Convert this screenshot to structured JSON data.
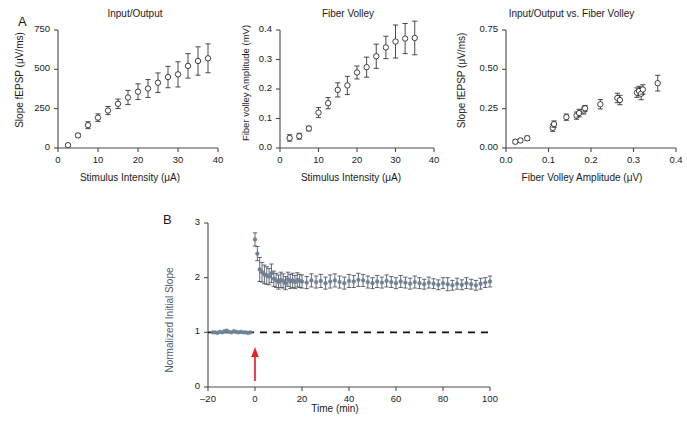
{
  "figure": {
    "panel_a_letter": "A",
    "panel_b_letter": "B"
  },
  "chart_data": [
    {
      "id": "input-output",
      "type": "scatter",
      "title": "Input/Output",
      "xlabel": "Stimulus Intensity (μA)",
      "ylabel": "Slope fEPSP (μV/ms)",
      "xlim": [
        0,
        40
      ],
      "ylim": [
        0,
        750
      ],
      "xticks": [
        0,
        10,
        20,
        30,
        40
      ],
      "xticklabels": [
        "0",
        "10",
        "20",
        "30",
        "40"
      ],
      "yticks": [
        0,
        250,
        500,
        750
      ],
      "yticklabels": [
        "0",
        "250",
        "500",
        "750"
      ],
      "grid": false,
      "legend": "none",
      "marker": "open-circle",
      "x": [
        2.5,
        5.0,
        7.5,
        10.0,
        12.5,
        15.0,
        17.5,
        20.0,
        22.5,
        25.0,
        27.5,
        30.0,
        32.5,
        35.0,
        37.5
      ],
      "values": [
        18,
        80,
        145,
        193,
        238,
        281,
        321,
        358,
        378,
        415,
        451,
        468,
        522,
        553,
        570
      ],
      "errors": [
        8,
        10,
        22,
        24,
        26,
        30,
        45,
        50,
        57,
        62,
        68,
        80,
        78,
        90,
        92
      ]
    },
    {
      "id": "fiber-volley",
      "type": "scatter",
      "title": "Fiber Volley",
      "xlabel": "Stimulus Intensity (μA)",
      "ylabel": "Fiber volley Amplitude (mV)",
      "xlim": [
        0,
        40
      ],
      "ylim": [
        0.0,
        0.4
      ],
      "xticks": [
        0,
        10,
        20,
        30,
        40
      ],
      "xticklabels": [
        "0",
        "10",
        "20",
        "30",
        "40"
      ],
      "yticks": [
        0.0,
        0.1,
        0.2,
        0.3,
        0.4
      ],
      "yticklabels": [
        "0.0",
        "0.1",
        "0.2",
        "0.3",
        "0.4"
      ],
      "grid": false,
      "legend": "none",
      "marker": "open-circle",
      "x": [
        2.5,
        5.0,
        7.5,
        10.0,
        12.5,
        15.0,
        17.5,
        20.0,
        22.5,
        25.0,
        27.5,
        30.0,
        32.5,
        35.0
      ],
      "values": [
        0.034,
        0.04,
        0.066,
        0.12,
        0.152,
        0.197,
        0.212,
        0.256,
        0.274,
        0.311,
        0.341,
        0.361,
        0.371,
        0.373
      ],
      "errors": [
        0.011,
        0.01,
        0.008,
        0.017,
        0.019,
        0.024,
        0.031,
        0.022,
        0.034,
        0.041,
        0.038,
        0.056,
        0.051,
        0.057
      ]
    },
    {
      "id": "io-vs-fiber-volley",
      "type": "scatter",
      "title": "Input/Output vs. Fiber Volley",
      "xlabel": "Fiber Volley Amplitude (μV)",
      "ylabel": "Slope fEPSP (μV/ms)",
      "xlim": [
        0.0,
        0.4
      ],
      "ylim": [
        0.0,
        0.75
      ],
      "xticks": [
        0.0,
        0.1,
        0.2,
        0.3,
        0.4
      ],
      "xticklabels": [
        "0.0",
        "0.1",
        "0.2",
        "0.3",
        "0.4"
      ],
      "yticks": [
        0.0,
        0.25,
        0.5,
        0.75
      ],
      "yticklabels": [
        "0.00",
        "0.25",
        "0.50",
        "0.75"
      ],
      "grid": false,
      "legend": "none",
      "marker": "open-circle",
      "x": [
        0.022,
        0.034,
        0.05,
        0.11,
        0.113,
        0.142,
        0.166,
        0.172,
        0.183,
        0.186,
        0.222,
        0.262,
        0.268,
        0.308,
        0.313,
        0.318,
        0.322,
        0.357
      ],
      "values": [
        0.04,
        0.048,
        0.062,
        0.128,
        0.152,
        0.196,
        0.206,
        0.222,
        0.238,
        0.252,
        0.278,
        0.318,
        0.305,
        0.352,
        0.362,
        0.345,
        0.372,
        0.412
      ],
      "errors": [
        0.012,
        0.012,
        0.014,
        0.022,
        0.02,
        0.02,
        0.023,
        0.024,
        0.022,
        0.018,
        0.03,
        0.03,
        0.03,
        0.03,
        0.03,
        0.038,
        0.03,
        0.05
      ]
    },
    {
      "id": "ltp-time-course",
      "type": "scatter",
      "title": "",
      "xlabel": "Time (min)",
      "ylabel": "Normalized Initial Slope",
      "xlim": [
        -20,
        100
      ],
      "ylim": [
        0,
        3
      ],
      "xticks": [
        -20,
        0,
        20,
        40,
        60,
        80,
        100
      ],
      "xticklabels": [
        "–20",
        "0",
        "20",
        "40",
        "60",
        "80",
        "100"
      ],
      "yticks": [
        0,
        1,
        2,
        3
      ],
      "yticklabels": [
        "0",
        "1",
        "2",
        "3"
      ],
      "grid": false,
      "legend": "none",
      "marker": "filled-circle",
      "marker_color": "#6f8196",
      "errorbar_color": "#3d4450",
      "baseline_value": 1.0,
      "baseline_style": "dashed",
      "stimulus_marker": {
        "x": 0,
        "symbol": "up-arrow",
        "color": "#e8232a"
      },
      "x": [
        -18,
        -17,
        -16,
        -15,
        -14,
        -13,
        -12,
        -11,
        -10,
        -9,
        -8,
        -7,
        -6,
        -5,
        -4,
        -3,
        -2,
        0,
        1,
        2,
        3,
        4,
        5,
        6,
        7,
        8,
        9,
        10,
        11,
        12,
        13,
        14,
        15,
        16,
        17,
        18,
        19,
        20,
        22,
        24,
        26,
        28,
        30,
        32,
        34,
        36,
        38,
        40,
        42,
        44,
        46,
        48,
        50,
        52,
        54,
        56,
        58,
        60,
        62,
        64,
        66,
        68,
        70,
        72,
        74,
        76,
        78,
        80,
        82,
        84,
        86,
        88,
        90,
        92,
        94,
        96,
        98,
        100
      ],
      "values": [
        1.0,
        1.0,
        0.99,
        1.01,
        1.0,
        1.02,
        1.03,
        1.01,
        1.0,
        1.02,
        1.01,
        1.0,
        1.01,
        1.0,
        1.0,
        0.99,
        1.0,
        2.7,
        2.44,
        2.15,
        2.1,
        2.06,
        2.04,
        2.02,
        2.08,
        1.98,
        1.95,
        1.92,
        1.96,
        1.94,
        1.9,
        1.97,
        1.93,
        1.95,
        1.92,
        1.96,
        1.94,
        1.93,
        1.91,
        1.95,
        1.92,
        1.94,
        1.9,
        1.93,
        1.95,
        1.92,
        1.9,
        1.94,
        1.93,
        1.96,
        1.95,
        1.92,
        1.9,
        1.93,
        1.91,
        1.94,
        1.92,
        1.9,
        1.93,
        1.91,
        1.89,
        1.92,
        1.9,
        1.88,
        1.91,
        1.89,
        1.87,
        1.9,
        1.88,
        1.86,
        1.89,
        1.87,
        1.9,
        1.88,
        1.86,
        1.89,
        1.91,
        1.93,
        1.9
      ],
      "errors": [
        0.02,
        0.02,
        0.02,
        0.02,
        0.02,
        0.03,
        0.03,
        0.02,
        0.02,
        0.02,
        0.02,
        0.02,
        0.02,
        0.02,
        0.02,
        0.02,
        0.02,
        0.12,
        0.13,
        0.22,
        0.18,
        0.17,
        0.16,
        0.15,
        0.17,
        0.14,
        0.13,
        0.13,
        0.14,
        0.13,
        0.12,
        0.13,
        0.13,
        0.13,
        0.12,
        0.13,
        0.12,
        0.12,
        0.11,
        0.12,
        0.11,
        0.12,
        0.11,
        0.12,
        0.12,
        0.11,
        0.11,
        0.12,
        0.11,
        0.12,
        0.11,
        0.11,
        0.1,
        0.11,
        0.1,
        0.11,
        0.1,
        0.1,
        0.11,
        0.1,
        0.1,
        0.11,
        0.1,
        0.09,
        0.1,
        0.09,
        0.09,
        0.1,
        0.12,
        0.09,
        0.1,
        0.09,
        0.1,
        0.09,
        0.09,
        0.1,
        0.09,
        0.1,
        0.09
      ]
    }
  ]
}
